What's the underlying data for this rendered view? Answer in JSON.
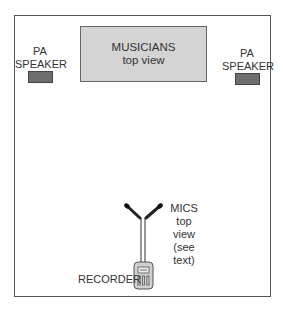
{
  "diagram": {
    "musicians": {
      "title": "MUSICIANS",
      "subtitle": "top view"
    },
    "left_speaker": {
      "line1": "PA",
      "line2": "SPEAKER"
    },
    "right_speaker": {
      "line1": "PA",
      "line2": "SPEAKER"
    },
    "mics": {
      "line1": "MICS",
      "line2": "top view",
      "line3": "(see text)"
    },
    "recorder": {
      "label": "RECORDER"
    }
  },
  "colors": {
    "musicians_fill": "#d4d4d4",
    "speaker_fill": "#6e6e6e",
    "border": "#555555",
    "recorder_fill": "#d0d0d0"
  }
}
